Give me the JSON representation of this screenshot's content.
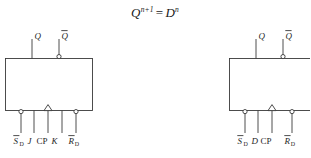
{
  "figure": {
    "equation": {
      "lhs_base": "Q",
      "lhs_sup": "n+1",
      "operator": "=",
      "rhs_base": "D",
      "rhs_sup": "n"
    },
    "stroke_color": "#3a3a3a",
    "text_color": "#1f1f1f",
    "background_color": "#ffffff",
    "symbols": [
      {
        "id": "jk-flip-flop",
        "name": "JK flip-flop symbol",
        "outputs": [
          {
            "label": "Q",
            "overbar": false,
            "inverted": false
          },
          {
            "label": "Q",
            "overbar": true,
            "inverted": true
          }
        ],
        "inputs": [
          {
            "label": "S",
            "sub": "D",
            "overbar": true,
            "inverted": true,
            "clock": false
          },
          {
            "label": "J",
            "sub": "",
            "overbar": false,
            "inverted": false,
            "clock": false
          },
          {
            "label": "CP",
            "sub": "",
            "overbar": false,
            "inverted": false,
            "clock": true
          },
          {
            "label": "K",
            "sub": "",
            "overbar": false,
            "inverted": false,
            "clock": false
          },
          {
            "label": "R",
            "sub": "D",
            "overbar": true,
            "inverted": true,
            "clock": false
          }
        ]
      },
      {
        "id": "d-flip-flop",
        "name": "D flip-flop symbol",
        "outputs": [
          {
            "label": "Q",
            "overbar": false,
            "inverted": false
          },
          {
            "label": "Q",
            "overbar": true,
            "inverted": true
          }
        ],
        "inputs": [
          {
            "label": "S",
            "sub": "D",
            "overbar": true,
            "inverted": true,
            "clock": false
          },
          {
            "label": "D",
            "sub": "",
            "overbar": false,
            "inverted": false,
            "clock": false
          },
          {
            "label": "CP",
            "sub": "",
            "overbar": false,
            "inverted": false,
            "clock": true
          },
          {
            "label": "R",
            "sub": "D",
            "overbar": true,
            "inverted": true,
            "clock": false
          }
        ]
      }
    ],
    "labels": {
      "jk": {
        "out_q": "Q",
        "out_qbar": "Q",
        "in_sd": "S",
        "in_sd_sub": "D",
        "in_j": "J",
        "in_cp": "CP",
        "in_k": "K",
        "in_rd": "R",
        "in_rd_sub": "D"
      },
      "d": {
        "out_q": "Q",
        "out_qbar": "Q",
        "in_sd": "S",
        "in_sd_sub": "D",
        "in_d": "D",
        "in_cp": "CP",
        "in_rd": "R",
        "in_rd_sub": "D"
      }
    }
  }
}
